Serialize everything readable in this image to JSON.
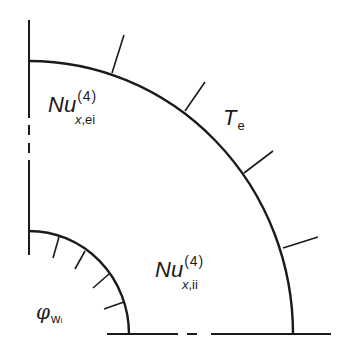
{
  "diagram": {
    "type": "quarter-annulus cross-section",
    "stroke_color": "#1a1a1a",
    "labels": {
      "outer_nusselt": {
        "main": "Nu",
        "superscript": "(4)",
        "subscript_var": "x",
        "subscript_rest": ",ei"
      },
      "inner_nusselt": {
        "main": "Nu",
        "superscript": "(4)",
        "subscript_var": "x",
        "subscript_rest": ",ii"
      },
      "outer_temperature": {
        "main": "T",
        "subscript": "e"
      },
      "inner_heat_flux": {
        "main": "φ",
        "subscript": "w",
        "subsubscript": "i"
      }
    },
    "outer_wall": {
      "boundary_condition": "constant temperature T_e",
      "hatch_ticks": 5
    },
    "inner_wall": {
      "boundary_condition": "heat flux φ_wi",
      "hatch_ticks": 4
    }
  }
}
